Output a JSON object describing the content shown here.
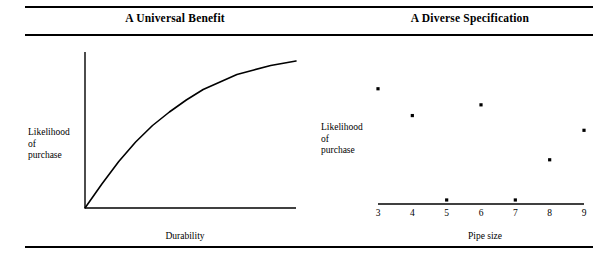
{
  "figure": {
    "width": 616,
    "height": 258,
    "background": "#ffffff",
    "ink": "#000000",
    "rules": [
      {
        "name": "top-rule",
        "y": 6
      },
      {
        "name": "under-title-rule",
        "y": 34
      },
      {
        "name": "bottom-rule",
        "y": 246
      }
    ]
  },
  "panels": {
    "left": {
      "title": "A Universal Benefit",
      "ylabel_lines": [
        "Likelihood",
        "of",
        "purchase"
      ],
      "xlabel": "Durability"
    },
    "right": {
      "title": "A Diverse Specification",
      "ylabel_lines": [
        "Likelihood",
        "of",
        "purchase"
      ],
      "xlabel": "Pipe size"
    }
  },
  "chart_data": [
    {
      "type": "line",
      "title": "A Universal Benefit",
      "xlabel": "Durability",
      "ylabel": "Likelihood of purchase",
      "grid": false,
      "legend": false,
      "axis_ticks": {
        "x": [],
        "y": []
      },
      "xlim": [
        0,
        1
      ],
      "ylim": [
        0,
        1
      ],
      "description": "Smooth concave increasing curve rising steeply from the origin then flattening toward the right",
      "series": [
        {
          "name": "Likelihood of purchase vs durability",
          "x": [
            0.0,
            0.08,
            0.16,
            0.24,
            0.32,
            0.4,
            0.48,
            0.56,
            0.64,
            0.72,
            0.8,
            0.88,
            0.96,
            1.0
          ],
          "y": [
            0.0,
            0.16,
            0.31,
            0.44,
            0.55,
            0.64,
            0.72,
            0.79,
            0.84,
            0.89,
            0.92,
            0.95,
            0.97,
            0.98
          ]
        }
      ]
    },
    {
      "type": "scatter",
      "title": "A Diverse Specification",
      "xlabel": "Pipe size",
      "ylabel": "Likelihood of purchase",
      "grid": false,
      "legend": false,
      "xlim": [
        3,
        9
      ],
      "ylim": [
        0,
        1
      ],
      "xticks": [
        "3",
        "4",
        "5",
        "6",
        "7",
        "8",
        "9"
      ],
      "yticks": [],
      "points": [
        {
          "x": 3,
          "y": 0.86
        },
        {
          "x": 4,
          "y": 0.66
        },
        {
          "x": 5,
          "y": 0.03
        },
        {
          "x": 6,
          "y": 0.74
        },
        {
          "x": 7,
          "y": 0.03
        },
        {
          "x": 8,
          "y": 0.33
        },
        {
          "x": 9,
          "y": 0.55
        }
      ]
    }
  ]
}
